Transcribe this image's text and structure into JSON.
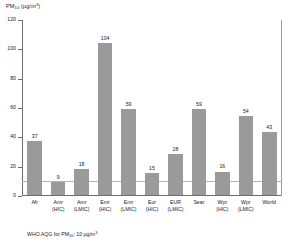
{
  "chart_data": {
    "type": "bar",
    "title": "",
    "ylabel": "PM10 (µg/m3)",
    "xlabel": "",
    "ylim": [
      0,
      120
    ],
    "yticks": [
      0,
      20,
      40,
      60,
      80,
      100,
      120
    ],
    "ytick_labels": [
      "0",
      "20",
      "40",
      "60",
      "80",
      "100",
      "120"
    ],
    "grid": false,
    "legend": "none",
    "categories": [
      "Afr",
      "Amr (HIC)",
      "Amr (LMIC)",
      "Emr (HIC)",
      "Emr (LMIC)",
      "Eur (HIC)",
      "EUR (LMIC)",
      "Sear",
      "Wpr (HIC)",
      "Wpr (LMIC)",
      "World"
    ],
    "category_lines": [
      [
        "Afr",
        ""
      ],
      [
        "Amr",
        "(HIC)"
      ],
      [
        "Amr",
        "(LMIC)"
      ],
      [
        "Emr",
        "(HIC)"
      ],
      [
        "Emr",
        "(LMIC)"
      ],
      [
        "Eur",
        "(HIC)"
      ],
      [
        "EUR",
        "(LMIC)"
      ],
      [
        "Sear",
        ""
      ],
      [
        "Wpr",
        "(HIC)"
      ],
      [
        "Wpr",
        "(LMIC)"
      ],
      [
        "World",
        ""
      ]
    ],
    "values": [
      37,
      9,
      18,
      104,
      59,
      15,
      28,
      59,
      16,
      54,
      43
    ],
    "value_labels": [
      "37",
      "9",
      "18",
      "104",
      "59",
      "15",
      "28",
      "59",
      "16",
      "54",
      "43"
    ],
    "reference_line": {
      "value": 10,
      "label": "WHO AQG for PM10: 10 µg/m3"
    },
    "bar_color": "#9a9a9a",
    "axis_color": "#6e6e6e",
    "reference_line_color": "#b4b4b4"
  },
  "axis": {
    "y_title_main": "PM",
    "y_title_sub": "10",
    "y_title_unit": " (µg/m",
    "y_title_sup": "3",
    "y_title_close": ")"
  },
  "footnote": {
    "prefix": "WHO AQG for PM",
    "sub": "10",
    "suffix": ": 10 µg/m",
    "sup": "3"
  }
}
